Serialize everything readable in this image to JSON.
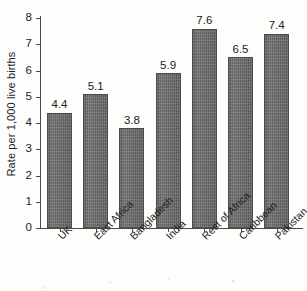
{
  "chart_data": {
    "type": "bar",
    "title": "",
    "xlabel": "",
    "ylabel": "Rate per 1,000 live births",
    "ylim": [
      0,
      8
    ],
    "yticks": [
      "0",
      "1",
      "2",
      "3",
      "4",
      "5",
      "6",
      "7",
      "8"
    ],
    "grid": false,
    "legend": null,
    "categories": [
      "UK",
      "East Africa",
      "Bangladesh",
      "India",
      "Rest of Africa",
      "Caribbean",
      "Pakistan"
    ],
    "values": [
      4.4,
      5.1,
      3.8,
      5.9,
      7.6,
      6.5,
      7.4
    ],
    "value_labels": [
      "4.4",
      "5.1",
      "3.8",
      "5.9",
      "7.6",
      "6.5",
      "7.4"
    ],
    "colors": {
      "bar_fill": "#6e6e6e",
      "bar_edge": "#4c4c4c",
      "axis": "#4a4a4a",
      "text": "#1c1c1c",
      "background": "#fdfdfb"
    }
  }
}
